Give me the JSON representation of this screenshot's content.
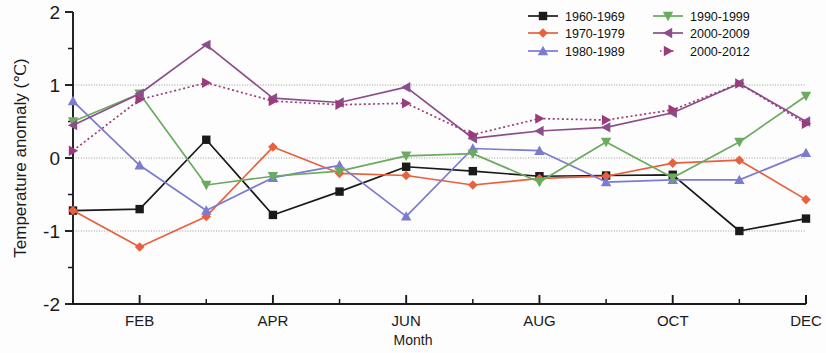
{
  "chart_data": {
    "type": "line",
    "title": "",
    "xlabel": "Month",
    "ylabel": "Temperature anomaly (℃)",
    "ylim": [
      -2,
      2
    ],
    "yticks": [
      -2,
      -1,
      0,
      1,
      2
    ],
    "yticklabels": [
      "-2",
      "-1",
      "0",
      "1",
      "2"
    ],
    "grid": "horizontal gridlines at -1, 0, 1",
    "legend_position": "top-right, two columns",
    "categories": [
      "JAN",
      "FEB",
      "MAR",
      "APR",
      "MAY",
      "JUN",
      "JUL",
      "AUG",
      "SEP",
      "OCT",
      "NOV",
      "DEC"
    ],
    "xticklabels": [
      "",
      "FEB",
      "",
      "APR",
      "",
      "JUN",
      "",
      "AUG",
      "",
      "OCT",
      "",
      "DEC"
    ],
    "series": [
      {
        "name": "1960-1969",
        "color": "#1a1a1a",
        "marker": "square",
        "linestyle": "solid",
        "values": [
          -0.72,
          -0.7,
          0.25,
          -0.78,
          -0.46,
          -0.12,
          -0.18,
          -0.25,
          -0.24,
          -0.23,
          -1.0,
          -0.83
        ]
      },
      {
        "name": "1970-1979",
        "color": "#e8603c",
        "marker": "diamond",
        "linestyle": "solid",
        "values": [
          -0.72,
          -1.22,
          -0.8,
          0.15,
          -0.21,
          -0.24,
          -0.37,
          -0.28,
          -0.25,
          -0.07,
          -0.03,
          -0.57
        ]
      },
      {
        "name": "1980-1989",
        "color": "#7b7bd0",
        "marker": "triangle-up",
        "linestyle": "solid",
        "values": [
          0.78,
          -0.1,
          -0.72,
          -0.27,
          -0.1,
          -0.8,
          0.13,
          0.1,
          -0.33,
          -0.3,
          -0.3,
          0.07
        ]
      },
      {
        "name": "1990-1999",
        "color": "#6aab5e",
        "marker": "triangle-down",
        "linestyle": "solid",
        "values": [
          0.5,
          0.88,
          -0.37,
          -0.25,
          -0.18,
          0.03,
          0.06,
          -0.33,
          0.22,
          -0.27,
          0.22,
          0.85
        ]
      },
      {
        "name": "2000-2009",
        "color": "#8b4e8b",
        "marker": "triangle-left",
        "linestyle": "solid",
        "values": [
          0.45,
          0.88,
          1.55,
          0.82,
          0.76,
          0.97,
          0.27,
          0.37,
          0.42,
          0.62,
          1.02,
          0.5
        ]
      },
      {
        "name": "2000-2012",
        "color": "#9c3b7a",
        "marker": "triangle-right",
        "linestyle": "dotted",
        "values": [
          0.1,
          0.8,
          1.03,
          0.78,
          0.73,
          0.75,
          0.32,
          0.54,
          0.52,
          0.66,
          1.02,
          0.47
        ]
      }
    ]
  }
}
